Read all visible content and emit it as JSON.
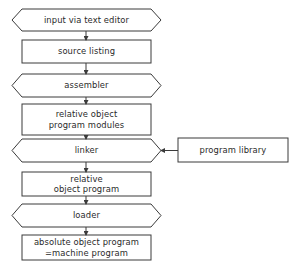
{
  "diagram": {
    "type": "flowchart",
    "stroke_color": "#3a3a3a",
    "background": "#ffffff",
    "nodes": [
      {
        "id": "n1",
        "shape": "hexagon",
        "label": "input via text editor"
      },
      {
        "id": "n2",
        "shape": "rectangle",
        "label": "source listing"
      },
      {
        "id": "n3",
        "shape": "hexagon",
        "label": "assembler"
      },
      {
        "id": "n4",
        "shape": "rectangle",
        "label": "relative object\nprogram modules"
      },
      {
        "id": "n5",
        "shape": "hexagon",
        "label": "linker"
      },
      {
        "id": "n6",
        "shape": "rectangle",
        "label": "relative\nobject program"
      },
      {
        "id": "n7",
        "shape": "hexagon",
        "label": "loader"
      },
      {
        "id": "n8",
        "shape": "rectangle",
        "label": "absolute object program\n=machine program"
      },
      {
        "id": "n9",
        "shape": "rectangle",
        "label": "program library"
      }
    ],
    "edges": [
      {
        "from": "n1",
        "to": "n2"
      },
      {
        "from": "n2",
        "to": "n3"
      },
      {
        "from": "n3",
        "to": "n4"
      },
      {
        "from": "n4",
        "to": "n5"
      },
      {
        "from": "n5",
        "to": "n6"
      },
      {
        "from": "n6",
        "to": "n7"
      },
      {
        "from": "n7",
        "to": "n8"
      },
      {
        "from": "n9",
        "to": "n5"
      }
    ]
  }
}
